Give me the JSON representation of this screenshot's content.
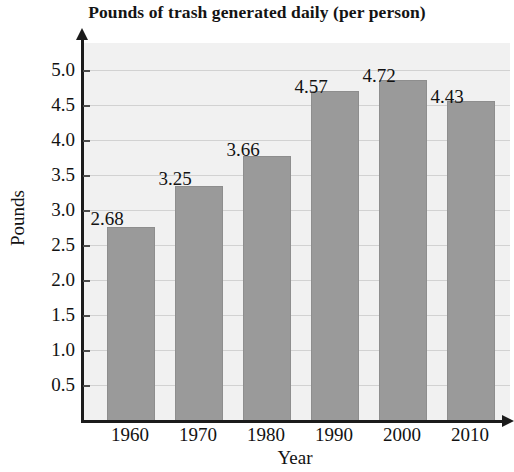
{
  "chart_data": {
    "type": "bar",
    "title": "Pounds of trash generated daily (per person)",
    "xlabel": "Year",
    "ylabel": "Pounds",
    "categories": [
      "1960",
      "1970",
      "1980",
      "1990",
      "2000",
      "2010"
    ],
    "values": [
      2.68,
      3.25,
      3.66,
      4.57,
      4.72,
      4.43
    ],
    "value_labels": [
      "2.68",
      "3.25",
      "3.66",
      "4.57",
      "4.72",
      "4.43"
    ],
    "ylim": [
      0,
      5.25
    ],
    "ytick_labels": [
      "0.5",
      "1.0",
      "1.5",
      "2.0",
      "2.5",
      "3.0",
      "3.5",
      "4.0",
      "4.5",
      "5.0"
    ],
    "ytick_values": [
      0.5,
      1.0,
      1.5,
      2.0,
      2.5,
      3.0,
      3.5,
      4.0,
      4.5,
      5.0
    ],
    "grid": true,
    "legend": null,
    "legend_position": "none",
    "series": [
      {
        "name": "Pounds of trash generated daily (per person)",
        "values": [
          2.68,
          3.25,
          3.66,
          4.57,
          4.72,
          4.43
        ]
      }
    ],
    "colors": {
      "bar_fill": "#9a9a9a",
      "bar_edge": "#8e8e8e",
      "plot_background": "#f1f1f1",
      "gridline": "#d2d2d2",
      "axis": "#1b1b1b",
      "text": "#121212",
      "page_background": "#ffffff"
    }
  }
}
